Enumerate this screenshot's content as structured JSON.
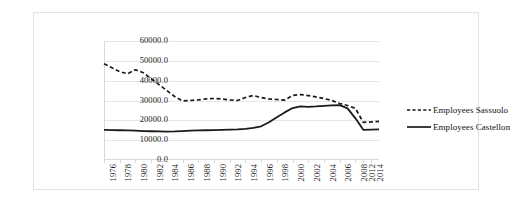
{
  "chart_data": {
    "type": "line",
    "title": "",
    "xlabel": "",
    "ylabel": "",
    "ylim": [
      0,
      60000
    ],
    "grid": true,
    "legend_position": "right",
    "ytick_labels": [
      "60000.0",
      "50000.0",
      "40000.0",
      "30000.0",
      "20000.0",
      "10000.0",
      "0.0"
    ],
    "ytick_values": [
      60000,
      50000,
      40000,
      30000,
      20000,
      10000,
      0
    ],
    "x": [
      1976,
      1977,
      1978,
      1979,
      1980,
      1981,
      1982,
      1983,
      1984,
      1985,
      1986,
      1987,
      1988,
      1989,
      1990,
      1991,
      1992,
      1993,
      1994,
      1995,
      1996,
      1997,
      1998,
      1999,
      2000,
      2001,
      2002,
      2003,
      2004,
      2005,
      2006,
      2007,
      2008,
      2012,
      2014,
      2015
    ],
    "xtick_labels": [
      "1976",
      "1978",
      "1980",
      "1982",
      "1984",
      "1986",
      "1988",
      "1990",
      "1992",
      "1994",
      "1996",
      "1998",
      "2000",
      "2002",
      "2004",
      "2006",
      "2008",
      "2012",
      "2014"
    ],
    "xtick_values": [
      1976,
      1978,
      1980,
      1982,
      1984,
      1986,
      1988,
      1990,
      1992,
      1994,
      1996,
      1998,
      2000,
      2002,
      2004,
      2006,
      2008,
      2012,
      2014
    ],
    "series": [
      {
        "name": "Employees Sassuolo",
        "style": "dashed",
        "color": "#1a1a1a",
        "values": [
          48500,
          46500,
          44500,
          43500,
          45500,
          44000,
          41000,
          38000,
          35000,
          32000,
          29800,
          30000,
          30300,
          30800,
          31000,
          30800,
          30300,
          30000,
          31500,
          32500,
          31500,
          30800,
          30500,
          30200,
          32500,
          33000,
          32500,
          31800,
          31000,
          30000,
          28500,
          27500,
          26000,
          19000,
          19200,
          19500
        ]
      },
      {
        "name": "Employees Castellon",
        "style": "solid",
        "color": "#1a1a1a",
        "values": [
          15200,
          15100,
          15000,
          14900,
          14800,
          14600,
          14500,
          14400,
          14300,
          14400,
          14600,
          14800,
          14900,
          15000,
          15100,
          15200,
          15300,
          15400,
          15700,
          16200,
          17000,
          19000,
          21500,
          24000,
          26200,
          27000,
          26800,
          27000,
          27300,
          27500,
          27700,
          26000,
          21000,
          15200,
          15300,
          15400
        ]
      }
    ]
  },
  "legend": {
    "entries": [
      {
        "label": "Employees Sassuolo"
      },
      {
        "label": "Employees Castellon"
      }
    ]
  }
}
